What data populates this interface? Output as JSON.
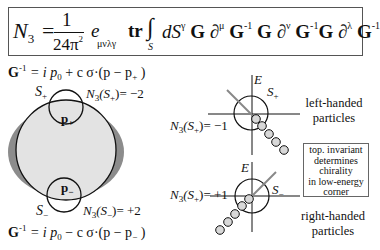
{
  "formula": {
    "lhs": "N",
    "lhs_sub": "3",
    "equals": "=",
    "numerator": "1",
    "denominator": "24π",
    "denominator_sup": "2",
    "epsilon": "e",
    "epsilon_sub": "μνλγ",
    "trace": "tr",
    "integral": "∫",
    "integral_sub": "S",
    "body_dS": "dS",
    "body_dS_sup": "γ",
    "G": "G",
    "partial": "∂",
    "mu": "μ",
    "nu": "ν",
    "lambda": "λ",
    "inv": "-1"
  },
  "top_green_function": {
    "lhs": "G",
    "lhs_sup": "-1",
    "rhs": "= i p",
    "rhs_sub": "0",
    "rhs_rest": "+ c σ·(p − p",
    "rhs_rest_sub": "+",
    "rhs_close": ")"
  },
  "bottom_green_function": {
    "lhs": "G",
    "lhs_sup": "-1",
    "rhs": "= i p",
    "rhs_sub": "0",
    "rhs_rest": "− c σ·(p − p",
    "rhs_rest_sub": "−",
    "rhs_close": ")"
  },
  "fermi_surface": {
    "s_plus_label": "S",
    "s_plus_sub": "+",
    "s_minus_label": "S",
    "s_minus_sub": "−",
    "p_plus": "p",
    "p_plus_sub": "+",
    "p_minus": "p",
    "p_minus_sub": "−",
    "n3_plus": "N",
    "n3_plus_mid": "(S",
    "n3_plus_arg_sub": "+",
    "n3_plus_value": ")= −2",
    "n3_minus": "N",
    "n3_minus_mid": "(S",
    "n3_minus_arg_sub": "−",
    "n3_minus_value": ")= +2",
    "n3_sub": "3",
    "colors": {
      "outer": "#8c8c8c",
      "inner": "#e3e3e3",
      "stroke": "#111111"
    }
  },
  "left_handed": {
    "axis_label": "E",
    "sphere_label": "S",
    "sphere_sub": "+",
    "n3": "N",
    "n3_sub": "3",
    "n3_mid": "(S",
    "n3_arg_sub": "+",
    "n3_value": ")= −1",
    "caption_line1": "left-handed",
    "caption_line2": "particles"
  },
  "right_handed": {
    "axis_label": "E",
    "sphere_label": "S",
    "sphere_sub": "−",
    "n3": "N",
    "n3_sub": "3",
    "n3_mid": "(S",
    "n3_arg_sub": "+",
    "n3_value": ")= +1",
    "caption_line1": "right-handed",
    "caption_line2": "particles"
  },
  "note": {
    "line1": "top. invariant",
    "line2": "determines",
    "line3": "chirality",
    "line4": "in low-energy",
    "line5": "corner"
  },
  "colors": {
    "dot_fill": "#d8d8d8",
    "line_gray": "#888888",
    "ink": "#111111"
  }
}
